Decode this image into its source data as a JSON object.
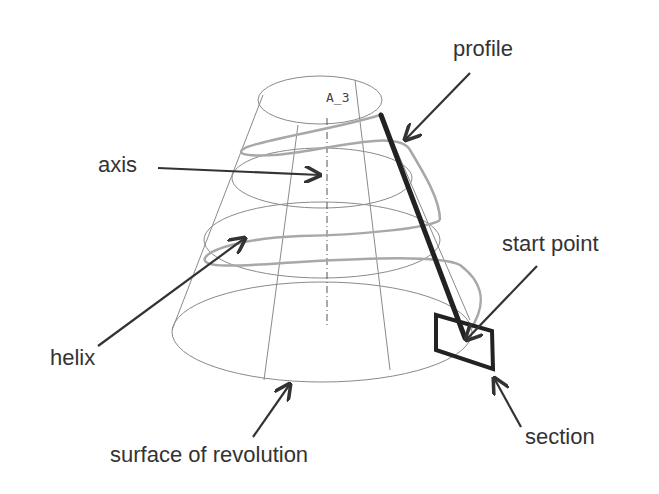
{
  "diagram": {
    "type": "helical sweep illustration",
    "labels": {
      "profile": "profile",
      "axis": "axis",
      "start_point": "start point",
      "helix": "helix",
      "section": "section",
      "surface": "surface of revolution",
      "axis_tag": "A_3"
    },
    "colors": {
      "wireframe": "#8a8a8a",
      "helix": "#a8a8a8",
      "profile": "#222222",
      "arrow": "#333333",
      "text": "#333333"
    }
  }
}
